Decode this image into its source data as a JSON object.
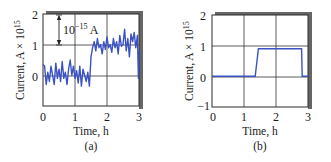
{
  "chart_data": [
    {
      "type": "line",
      "panel": "(a)",
      "title": "",
      "xlabel": "Time, h",
      "ylabel": "Current, A × 10^15",
      "xlim": [
        0,
        3
      ],
      "ylim": [
        -1,
        2
      ],
      "xticks": [
        "0",
        "1",
        "2",
        "3"
      ],
      "yticks": [
        "0",
        "1",
        "2"
      ],
      "grid": true,
      "annotation": {
        "text": "10^-15 A",
        "arrow_from": 2,
        "arrow_to": 1,
        "x": 0.5
      },
      "series": [
        {
          "name": "measured current (noisy)",
          "color": "#3b52c4",
          "x": [
            0.0,
            0.05,
            0.1,
            0.15,
            0.2,
            0.25,
            0.3,
            0.35,
            0.4,
            0.45,
            0.5,
            0.55,
            0.6,
            0.65,
            0.7,
            0.75,
            0.8,
            0.85,
            0.9,
            0.95,
            1.0,
            1.05,
            1.1,
            1.15,
            1.2,
            1.25,
            1.3,
            1.35,
            1.4,
            1.45,
            1.5,
            1.55,
            1.6,
            1.65,
            1.7,
            1.75,
            1.8,
            1.85,
            1.9,
            1.95,
            2.0,
            2.05,
            2.1,
            2.15,
            2.2,
            2.25,
            2.3,
            2.35,
            2.4,
            2.45,
            2.5,
            2.55,
            2.6,
            2.65,
            2.7,
            2.75,
            2.8,
            2.85,
            2.9,
            2.95,
            2.98,
            3.0
          ],
          "values": [
            0.35,
            0.3,
            -0.3,
            0.1,
            -0.2,
            0.3,
            0.0,
            -0.3,
            0.4,
            -0.1,
            0.2,
            -0.2,
            0.45,
            -0.1,
            0.1,
            -0.3,
            0.2,
            0.5,
            0.0,
            0.3,
            -0.1,
            0.15,
            -0.25,
            0.3,
            -0.35,
            0.2,
            0.0,
            -0.2,
            0.1,
            -0.35,
            0.6,
            0.9,
            1.1,
            0.8,
            1.2,
            0.9,
            1.0,
            0.7,
            1.1,
            0.85,
            1.25,
            0.9,
            1.0,
            0.75,
            1.2,
            0.9,
            1.1,
            0.7,
            1.3,
            0.95,
            1.0,
            1.5,
            0.8,
            1.2,
            0.6,
            1.35,
            1.1,
            1.4,
            0.9,
            1.3,
            -0.1,
            0.8
          ]
        }
      ]
    },
    {
      "type": "line",
      "panel": "(b)",
      "title": "",
      "xlabel": "Time, h",
      "ylabel": "Current, A × 10^15",
      "xlim": [
        0,
        3
      ],
      "ylim": [
        -1,
        2
      ],
      "xticks": [
        "0",
        "1",
        "2",
        "3"
      ],
      "yticks": [
        "-1",
        "0",
        "1",
        "2"
      ],
      "grid": true,
      "series": [
        {
          "name": "idealized step current",
          "color": "#3b52c4",
          "x": [
            0,
            1.35,
            1.45,
            2.8,
            2.82,
            3.0
          ],
          "values": [
            0,
            0,
            0.9,
            0.9,
            0,
            0
          ]
        }
      ]
    }
  ],
  "panels": {
    "a": {
      "caption": "(a)",
      "xlabel": "Time, h",
      "ylabel_main": "Current, A × 10",
      "ylabel_exp": "15",
      "xticks": [
        "0",
        "1",
        "2",
        "3"
      ],
      "yticks": [
        "2",
        "1",
        "0"
      ],
      "annotation_base": "10",
      "annotation_exp": "−15",
      "annotation_unit": " A"
    },
    "b": {
      "caption": "(b)",
      "xlabel": "Time, h",
      "ylabel_main": "Current, A × 10",
      "ylabel_exp": "15",
      "xticks": [
        "0",
        "1",
        "2",
        "3"
      ],
      "yticks": [
        "2",
        "1",
        "0",
        "−1"
      ]
    }
  },
  "colors": {
    "line": "#3b52c4",
    "grid": "#2a2a2a",
    "shadow": "#555555"
  }
}
